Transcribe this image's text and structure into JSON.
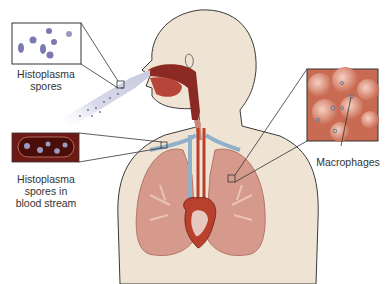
{
  "diagram": {
    "labels": {
      "spores": [
        "Histoplasma",
        "spores"
      ],
      "blood": [
        "Histoplasma",
        "spores in",
        "blood stream"
      ],
      "macrophages": "Macrophages"
    },
    "colors": {
      "skin": "#efe3d3",
      "outline": "#3a3a3a",
      "lung": "#d69a8c",
      "lung_dark": "#b9756a",
      "blood_box": "#6e1a14",
      "macro_bg": "#c96a52",
      "spore": "#7a7ab0",
      "vessel_blue": "#8fb0c8",
      "vessel_red": "#b8402c"
    }
  }
}
